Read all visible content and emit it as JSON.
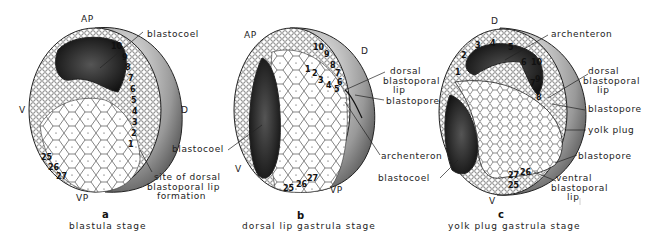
{
  "panels": [
    {
      "letter": "a",
      "caption": "blastula stage",
      "axes": {
        "top": "AP",
        "bottom": "VP",
        "left": "V",
        "right": "D"
      },
      "labels": [
        "blastocoel",
        "site of dorsal",
        "blastoporal lip",
        "formation"
      ],
      "numbers": [
        "10",
        "9",
        "8",
        "7",
        "6",
        "5",
        "4",
        "3",
        "2",
        "1",
        "25",
        "26",
        "27"
      ]
    },
    {
      "letter": "b",
      "caption": "dorsal lip gastrula stage",
      "axes": {
        "top": "AP",
        "bottom": "VP",
        "left": "V",
        "right": "D"
      },
      "labels": [
        "dorsal",
        "blastoporal",
        "lip",
        "blastopore",
        "archenteron",
        "blastocoel"
      ],
      "numbers": [
        "10",
        "9",
        "8",
        "7",
        "6",
        "5",
        "4",
        "3",
        "2",
        "1",
        "25",
        "26",
        "27"
      ]
    },
    {
      "letter": "c",
      "caption": "yolk plug gastrula stage",
      "axes": {
        "top": "D",
        "bottom": "V"
      },
      "labels": [
        "archenteron",
        "dorsal",
        "blastoporal",
        "lip",
        "blastopore",
        "yolk plug",
        "blastopore",
        "ventral",
        "blastoporal",
        "lip",
        "blastocoel"
      ],
      "numbers": [
        "1",
        "2",
        "3",
        "4",
        "5",
        "6",
        "10",
        "9",
        "7",
        "8",
        "27",
        "26",
        "25"
      ]
    }
  ]
}
